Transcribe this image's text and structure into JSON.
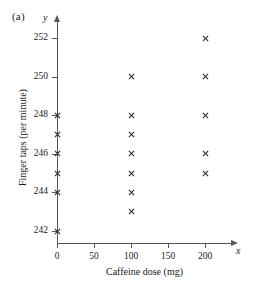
{
  "figure": {
    "panel_label": "(a)",
    "marker_symbol": "×",
    "marker_color": "#2b2b2b",
    "axis_color": "#555555"
  },
  "chart_data": {
    "type": "scatter",
    "title": "",
    "xlabel": "Caffeine dose (mg)",
    "ylabel": "Finger taps (per minute)",
    "x_axis_variable": "x",
    "y_axis_variable": "y",
    "xlim": [
      -12,
      225
    ],
    "ylim": [
      241.2,
      252.9
    ],
    "xticks": [
      0,
      50,
      100,
      150,
      200
    ],
    "yticks": [
      242,
      244,
      246,
      248,
      250,
      252
    ],
    "xtick_labels": [
      "0",
      "50",
      "100",
      "150",
      "200"
    ],
    "ytick_labels": [
      "242",
      "244",
      "246",
      "248",
      "250",
      "252"
    ],
    "grid": false,
    "legend": false,
    "points": [
      {
        "x": 0,
        "y": 248
      },
      {
        "x": 0,
        "y": 247
      },
      {
        "x": 0,
        "y": 246
      },
      {
        "x": 0,
        "y": 245
      },
      {
        "x": 0,
        "y": 244
      },
      {
        "x": 0,
        "y": 242
      },
      {
        "x": 100,
        "y": 250
      },
      {
        "x": 100,
        "y": 248
      },
      {
        "x": 100,
        "y": 247
      },
      {
        "x": 100,
        "y": 246
      },
      {
        "x": 100,
        "y": 245
      },
      {
        "x": 100,
        "y": 244
      },
      {
        "x": 100,
        "y": 243
      },
      {
        "x": 200,
        "y": 252
      },
      {
        "x": 200,
        "y": 250
      },
      {
        "x": 200,
        "y": 248
      },
      {
        "x": 200,
        "y": 246
      },
      {
        "x": 200,
        "y": 245
      }
    ],
    "groups": [
      {
        "dose": 0,
        "values": [
          248,
          247,
          246,
          245,
          244,
          242
        ]
      },
      {
        "dose": 100,
        "values": [
          250,
          248,
          247,
          246,
          245,
          244,
          243
        ]
      },
      {
        "dose": 200,
        "values": [
          252,
          250,
          248,
          246,
          245
        ]
      }
    ]
  }
}
